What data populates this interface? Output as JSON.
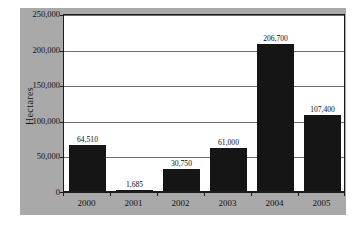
{
  "chart_data": {
    "type": "bar",
    "title": "",
    "xlabel": "",
    "ylabel": "Hectares",
    "categories": [
      "2000",
      "2001",
      "2002",
      "2003",
      "2004",
      "2005"
    ],
    "values": [
      64510,
      1685,
      30750,
      61000,
      206700,
      107400
    ],
    "value_labels": [
      "64,510",
      "1,685",
      "30,750",
      "61,000",
      "206,700",
      "107,400"
    ],
    "ylim": [
      0,
      250000
    ],
    "ytick_values": [
      0,
      50000,
      100000,
      150000,
      200000,
      250000
    ],
    "ytick_labels": [
      "0",
      "50,000",
      "100,000",
      "150,000",
      "200,000",
      "250,000"
    ],
    "grid": true,
    "legend": false,
    "bar_color": "#151515",
    "panel_color": "#a9a9a9",
    "plot_background": "#ffffff",
    "gridline_color": "#6e6e6e",
    "axis_color": "#1b1b1b"
  }
}
